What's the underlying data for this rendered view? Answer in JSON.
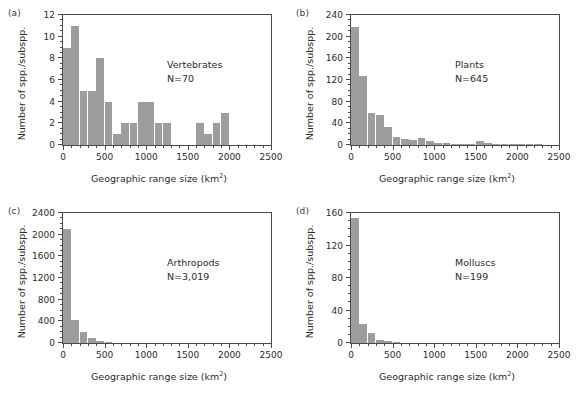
{
  "figure": {
    "background": "#ffffff",
    "bar_color": "#9d9d9d",
    "axis_color": "#4a4a4a",
    "text_color": "#2b2b2b",
    "shared_xlabel": "Geographic range size (km",
    "shared_xlabel_sup": "2",
    "shared_xlabel_tail": ")",
    "shared_ylabel": "Number of spp./subspp."
  },
  "panels": [
    {
      "letter": "(a)",
      "name": "Vertebrates",
      "n_label": "N=70"
    },
    {
      "letter": "(b)",
      "name": "Plants",
      "n_label": "N=645"
    },
    {
      "letter": "(c)",
      "name": "Arthropods",
      "n_label": "N=3,019"
    },
    {
      "letter": "(d)",
      "name": "Molluscs",
      "n_label": "N=199"
    }
  ],
  "chart_data": [
    {
      "type": "bar",
      "panel": "a",
      "title": "Vertebrates",
      "annotation": "N=70",
      "xlabel": "Geographic range size (km2)",
      "ylabel": "Number of spp./subspp.",
      "xlim": [
        0,
        2500
      ],
      "ylim": [
        0,
        12
      ],
      "xticks": [
        0,
        500,
        1000,
        1500,
        2000,
        2500
      ],
      "xticklabels": [
        "0",
        "500",
        "1000",
        "1500",
        "2000",
        "2500"
      ],
      "xtick_minor_step": 100,
      "yticks": [
        0,
        2,
        4,
        6,
        8,
        10,
        12
      ],
      "yticklabels": [
        "0",
        "2",
        "4",
        "6",
        "8",
        "10",
        "12"
      ],
      "ytick_minor_step": 0.5,
      "grid": false,
      "legend": "none",
      "bin_width": 100,
      "bin_starts": [
        0,
        100,
        200,
        300,
        400,
        500,
        600,
        700,
        800,
        900,
        1000,
        1100,
        1200,
        1600,
        1700,
        1800,
        1900
      ],
      "values": [
        9,
        11,
        5,
        5,
        8,
        4,
        1,
        2,
        2,
        4,
        4,
        2,
        2,
        2,
        1,
        2,
        3
      ]
    },
    {
      "type": "bar",
      "panel": "b",
      "title": "Plants",
      "annotation": "N=645",
      "xlabel": "Geographic range size (km2)",
      "ylabel": "Number of spp./subspp.",
      "xlim": [
        0,
        2500
      ],
      "ylim": [
        0,
        240
      ],
      "xticks": [
        0,
        500,
        1000,
        1500,
        2000,
        2500
      ],
      "xticklabels": [
        "0",
        "500",
        "1000",
        "1500",
        "2000",
        "2500"
      ],
      "xtick_minor_step": 100,
      "yticks": [
        0,
        40,
        80,
        120,
        160,
        200,
        240
      ],
      "yticklabels": [
        "0",
        "40",
        "80",
        "120",
        "160",
        "200",
        "240"
      ],
      "ytick_minor_step": 10,
      "grid": false,
      "legend": "none",
      "bin_width": 100,
      "bin_starts": [
        0,
        100,
        200,
        300,
        400,
        500,
        600,
        700,
        800,
        900,
        1000,
        1100,
        1200,
        1300,
        1400,
        1500,
        1600,
        1700,
        1800,
        1900,
        2000,
        2100,
        2200
      ],
      "values": [
        218,
        127,
        60,
        56,
        34,
        15,
        12,
        10,
        13,
        8,
        4,
        4,
        1,
        1,
        1,
        7,
        3,
        2,
        2,
        1,
        1,
        1,
        1
      ]
    },
    {
      "type": "bar",
      "panel": "c",
      "title": "Arthropods",
      "annotation": "N=3,019",
      "xlabel": "Geographic range size (km2)",
      "ylabel": "Number of spp./subspp.",
      "xlim": [
        0,
        2500
      ],
      "ylim": [
        0,
        2400
      ],
      "xticks": [
        0,
        500,
        1000,
        1500,
        2000,
        2500
      ],
      "xticklabels": [
        "0",
        "500",
        "1000",
        "1500",
        "2000",
        "2500"
      ],
      "xtick_minor_step": 100,
      "yticks": [
        0,
        400,
        800,
        1200,
        1600,
        2000,
        2400
      ],
      "yticklabels": [
        "0",
        "400",
        "800",
        "1200",
        "1600",
        "2000",
        "2400"
      ],
      "ytick_minor_step": 100,
      "grid": false,
      "legend": "none",
      "bin_width": 100,
      "bin_starts": [
        0,
        100,
        200,
        300,
        400,
        500
      ],
      "values": [
        2110,
        430,
        210,
        100,
        30,
        10
      ]
    },
    {
      "type": "bar",
      "panel": "d",
      "title": "Molluscs",
      "annotation": "N=199",
      "xlabel": "Geographic range size (km2)",
      "ylabel": "Number of spp./subspp.",
      "xlim": [
        0,
        2500
      ],
      "ylim": [
        0,
        160
      ],
      "xticks": [
        0,
        500,
        1000,
        1500,
        2000,
        2500
      ],
      "xticklabels": [
        "0",
        "500",
        "1000",
        "1500",
        "2000",
        "2500"
      ],
      "xtick_minor_step": 100,
      "yticks": [
        0,
        40,
        80,
        120,
        160
      ],
      "yticklabels": [
        "0",
        "40",
        "80",
        "120",
        "160"
      ],
      "ytick_minor_step": 10,
      "grid": false,
      "legend": "none",
      "bin_width": 100,
      "bin_starts": [
        0,
        100,
        200,
        300,
        400,
        500
      ],
      "values": [
        154,
        24,
        12,
        4,
        2,
        1
      ]
    }
  ]
}
